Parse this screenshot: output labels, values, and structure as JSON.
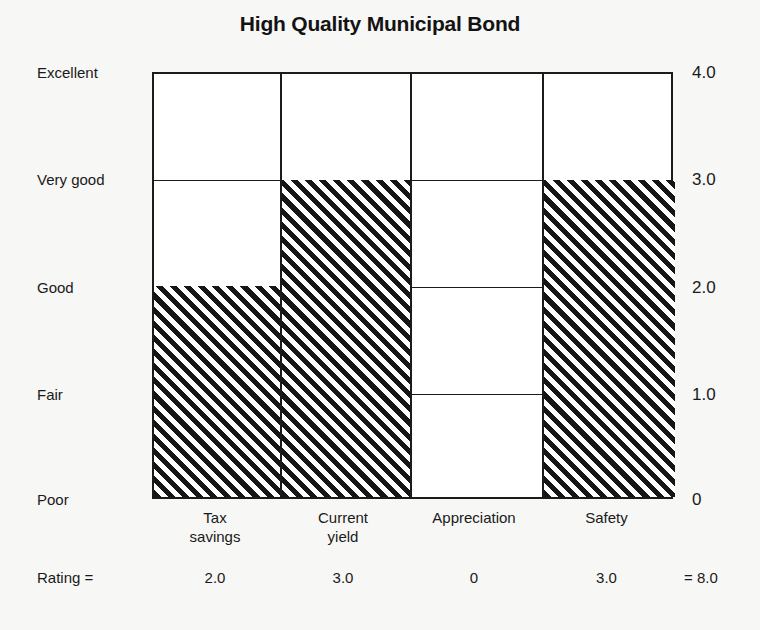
{
  "chart_data": {
    "type": "bar",
    "title": "High Quality Municipal Bond",
    "xlabel": "",
    "ylabel": "",
    "categories": [
      "Tax savings",
      "Current yield",
      "Appreciation",
      "Safety"
    ],
    "values": [
      2.0,
      3.0,
      0,
      3.0
    ],
    "value_labels": [
      "2.0",
      "3.0",
      "0",
      "3.0"
    ],
    "category_lines": [
      [
        "Tax",
        "savings"
      ],
      [
        "Current",
        "yield"
      ],
      [
        "Appreciation",
        ""
      ],
      [
        "Safety",
        ""
      ]
    ],
    "ylim": [
      0,
      4
    ],
    "ytick_values": [
      4.0,
      3.0,
      2.0,
      1.0,
      0
    ],
    "ytick_numeric_labels": [
      "4.0",
      "3.0",
      "2.0",
      "1.0",
      "0"
    ],
    "ytick_word_labels": [
      "Excellent",
      "Very good",
      "Good",
      "Fair",
      "Poor"
    ],
    "grid": true,
    "legend": "none",
    "fill_style": "diagonal-hatch",
    "total": 8.0,
    "total_label": "= 8.0",
    "rating_row_label": "Rating ="
  },
  "colors": {
    "background": "#f7f7f5",
    "plot_background": "#ffffff",
    "ink": "#1b1b1b",
    "hatch": "#161616"
  }
}
